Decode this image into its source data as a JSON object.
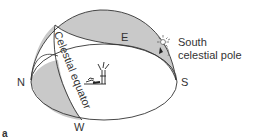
{
  "diagram": {
    "labels": {
      "north": "N",
      "south": "S",
      "east": "E",
      "west": "W",
      "equator": "Celestial equator",
      "pole_line1": "South",
      "pole_line2": "celestial pole",
      "figure": "a"
    },
    "icons": {
      "sun": "sun-icon",
      "observer": "observer-figure"
    },
    "colors": {
      "shade": "#c9c9c9",
      "line": "#333333",
      "background": "#ffffff"
    }
  }
}
